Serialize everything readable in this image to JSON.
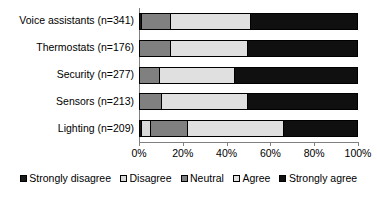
{
  "chart_data": {
    "type": "bar",
    "orientation": "horizontal",
    "stacked": true,
    "stack_mode": "percent",
    "title": "",
    "subtitle": "",
    "xlabel": "",
    "ylabel": "",
    "xlim": [
      0,
      100
    ],
    "grid": false,
    "legend_position": "bottom",
    "categories": [
      "Voice assistants (n=341)",
      "Thermostats (n=176)",
      "Security (n=277)",
      "Sensors (n=213)",
      "Lighting (n=209)"
    ],
    "xtick_labels": [
      "0%",
      "20%",
      "40%",
      "60%",
      "80%",
      "100%"
    ],
    "xtick_values": [
      0,
      20,
      40,
      60,
      80,
      100
    ],
    "series": [
      {
        "name": "Strongly disagree",
        "color": "#1a1a1a",
        "values": [
          1.5,
          0,
          0,
          0,
          1.5
        ]
      },
      {
        "name": "Disagree",
        "color": "#d9d9d9",
        "values": [
          0,
          0,
          0,
          0,
          4
        ]
      },
      {
        "name": "Neutral",
        "color": "#808080",
        "values": [
          13,
          14.5,
          9.5,
          10.5,
          17
        ]
      },
      {
        "name": "Agree",
        "color": "#e0e0e0",
        "values": [
          36.5,
          35.5,
          34.5,
          39.5,
          43.5
        ]
      },
      {
        "name": "Strongly agree",
        "color": "#101010",
        "values": [
          49,
          50,
          56,
          50,
          34
        ]
      }
    ]
  },
  "legend": {
    "items": [
      {
        "label": "Strongly disagree",
        "color": "#1a1a1a"
      },
      {
        "label": "Disagree",
        "color": "#d9d9d9"
      },
      {
        "label": "Neutral",
        "color": "#808080"
      },
      {
        "label": "Agree",
        "color": "#e0e0e0"
      },
      {
        "label": "Strongly agree",
        "color": "#101010"
      }
    ]
  }
}
